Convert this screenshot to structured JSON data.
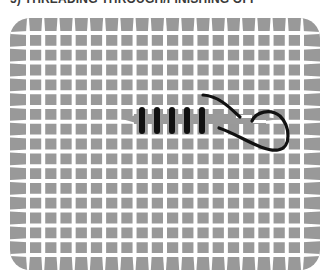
{
  "title": "5) THREADING THROUGH/FINISHING OFF",
  "diagram": {
    "type": "needlepoint-canvas-stitch-illustration",
    "grid": {
      "columns": 18,
      "rows": 15
    },
    "colors": {
      "canvas": "#999999",
      "holes": "#ffffff",
      "stitch": "#111111",
      "thread_under": "#9a9a9a"
    },
    "stitch_count": 5
  }
}
